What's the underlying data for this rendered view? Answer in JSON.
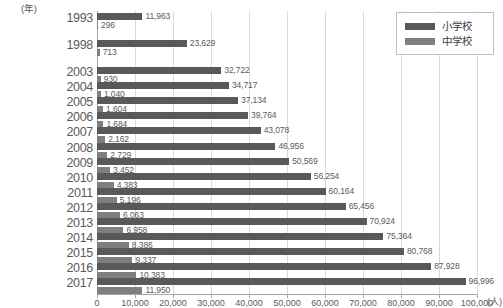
{
  "chart_data": {
    "type": "bar",
    "orientation": "horizontal",
    "title": "",
    "xlabel": "(人)",
    "ylabel": "(年)",
    "xlim": [
      0,
      100000
    ],
    "xticks": [
      0,
      10000,
      20000,
      30000,
      40000,
      50000,
      60000,
      70000,
      80000,
      90000,
      100000
    ],
    "xticklabels": [
      "0",
      "10,000",
      "20,000",
      "30,000",
      "40,000",
      "50,000",
      "60,000",
      "70,000",
      "80,000",
      "90,000",
      "100,000"
    ],
    "grid": true,
    "legend_position": "top-right",
    "categories": [
      "1993",
      "1998",
      "2003",
      "2004",
      "2005",
      "2006",
      "2007",
      "2008",
      "2009",
      "2010",
      "2011",
      "2012",
      "2013",
      "2014",
      "2015",
      "2016",
      "2017"
    ],
    "series": [
      {
        "name": "小学校",
        "color": "#595959",
        "values": [
          11963,
          23629,
          32722,
          34717,
          37134,
          39764,
          43078,
          46956,
          50569,
          56254,
          60164,
          65456,
          70924,
          75364,
          80768,
          87928,
          96996
        ],
        "labels": [
          "11,963",
          "23,629",
          "32,722",
          "34,717",
          "37,134",
          "39,764",
          "43,078",
          "46,956",
          "50,569",
          "56,254",
          "60,164",
          "65,456",
          "70,924",
          "75,364",
          "80,768",
          "87,928",
          "96,996"
        ]
      },
      {
        "name": "中学校",
        "color": "#7f7f7f",
        "values": [
          296,
          713,
          930,
          1040,
          1604,
          1684,
          2162,
          2729,
          3452,
          4383,
          5196,
          6063,
          6958,
          8386,
          9337,
          10383,
          11950
        ],
        "labels": [
          "296",
          "713",
          "930",
          "1,040",
          "1,604",
          "1,684",
          "2,162",
          "2,729",
          "3,452",
          "4,383",
          "5,196",
          "6,063",
          "6,958",
          "8,386",
          "9,337",
          "10,383",
          "11,950"
        ]
      }
    ]
  },
  "legend": {
    "items": [
      {
        "label": "小学校",
        "color": "#595959"
      },
      {
        "label": "中学校",
        "color": "#7f7f7f"
      }
    ]
  },
  "axes": {
    "y_unit": "(年)",
    "x_unit": "(人)"
  }
}
